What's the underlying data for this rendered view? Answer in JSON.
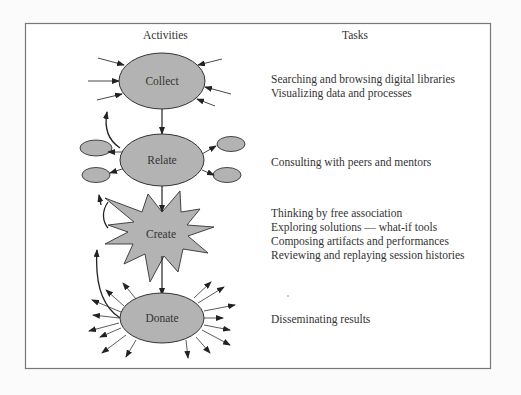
{
  "headers": {
    "activities": "Activities",
    "tasks": "Tasks"
  },
  "nodes": {
    "collect": "Collect",
    "relate": "Relate",
    "create": "Create",
    "donate": "Donate"
  },
  "tasks": {
    "collect": [
      "Searching and browsing digital libraries",
      "Visualizing data and processes"
    ],
    "relate": [
      "Consulting with peers and mentors"
    ],
    "create": [
      "Thinking by free association",
      "Exploring solutions — what-if tools",
      "Composing artifacts and performances",
      "Reviewing and replaying session histories"
    ],
    "donate": [
      "Disseminating results"
    ]
  },
  "colors": {
    "node_fill": "#b3b3b3",
    "stroke": "#333333",
    "frame": "#777777"
  }
}
